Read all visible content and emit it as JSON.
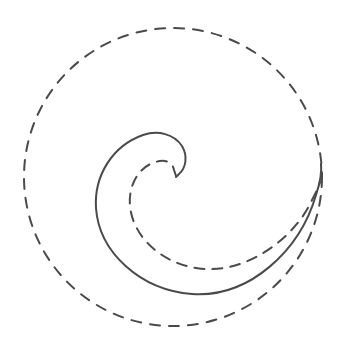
{
  "diagram": {
    "type": "spiral-in-circle",
    "colors": {
      "background": "#ffffff",
      "stroke": "#4a4a4a"
    },
    "elements": [
      {
        "id": "outer-circle",
        "style": "dashed",
        "center": [
          173,
          177
        ],
        "radius": 149
      },
      {
        "id": "solid-spiral",
        "style": "solid",
        "start": [
          176,
          177
        ],
        "end": [
          321,
          165
        ]
      },
      {
        "id": "dashed-spiral",
        "style": "dashed",
        "start": [
          176,
          170
        ],
        "end": [
          320,
          185
        ]
      }
    ]
  }
}
